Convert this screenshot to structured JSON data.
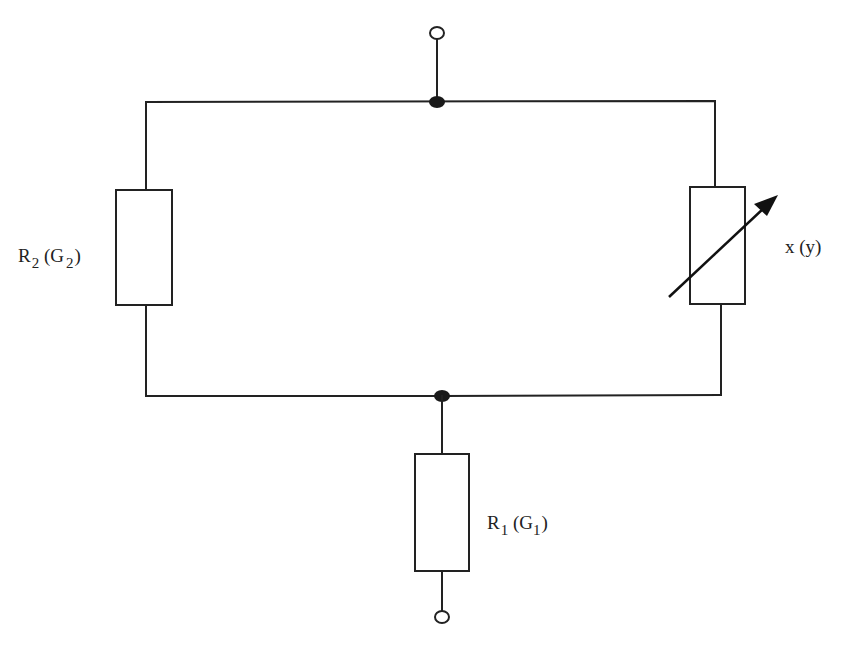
{
  "diagram": {
    "type": "circuit-schematic",
    "colors": {
      "line": "#222222",
      "junction": "#1a1a1a",
      "background": "#ffffff"
    },
    "components": {
      "r2": {
        "symbol": "R",
        "symbol_sub": "2",
        "alt_symbol": "G",
        "alt_sub": "2",
        "kind": "fixed-resistor"
      },
      "x": {
        "label": "x (y)",
        "kind": "variable-resistor"
      },
      "r1": {
        "symbol": "R",
        "symbol_sub": "1",
        "alt_symbol": "G",
        "alt_sub": "1",
        "kind": "fixed-resistor"
      }
    },
    "terminals": [
      {
        "name": "top-terminal"
      },
      {
        "name": "bottom-terminal"
      }
    ],
    "junctions": [
      {
        "name": "top-junction"
      },
      {
        "name": "bottom-junction"
      }
    ],
    "labels": {
      "r2_open": "R",
      "r2_sub": "2",
      "r2_paren_open": " (G",
      "r2_alt_sub": "2",
      "r2_paren_close": ")",
      "x_label": "x (y)",
      "r1_open": "R",
      "r1_sub": "1",
      "r1_paren_open": " (G",
      "r1_alt_sub": "1",
      "r1_paren_close": ")"
    }
  }
}
